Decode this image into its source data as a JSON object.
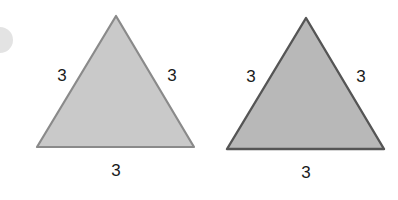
{
  "figures": [
    {
      "name": "triangle-a",
      "fill": "#c9c9c9",
      "stroke": "#8a8a8a",
      "labels": {
        "left_side": "3",
        "right_side": "3",
        "base": "3"
      }
    },
    {
      "name": "triangle-b",
      "fill": "#b8b8b8",
      "stroke": "#555555",
      "labels": {
        "left_side": "3",
        "right_side": "3",
        "base": "3"
      }
    }
  ],
  "decor": {
    "circle_color": "#e3e3e3"
  }
}
